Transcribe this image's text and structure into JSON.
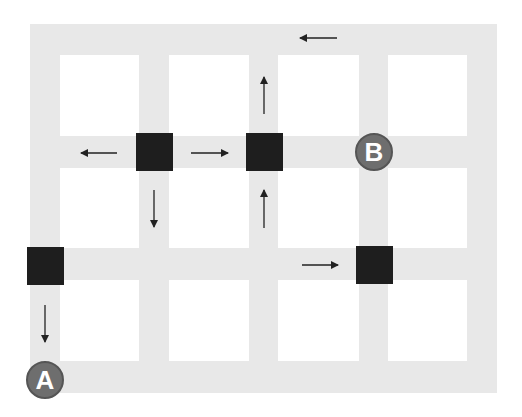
{
  "diagram": {
    "type": "street-grid-map",
    "colors": {
      "road": "#e8e8e8",
      "block": "#ffffff",
      "signal": "#1e1e1e",
      "marker": "#6e6e6e",
      "marker_text": "#ffffff",
      "arrow": "#222222"
    },
    "outer": {
      "x": 30,
      "y": 24,
      "w": 467,
      "h": 369
    },
    "blocks": [
      {
        "x": 60,
        "y": 55,
        "w": 79,
        "h": 81
      },
      {
        "x": 169,
        "y": 55,
        "w": 80,
        "h": 81
      },
      {
        "x": 278,
        "y": 55,
        "w": 81,
        "h": 81
      },
      {
        "x": 388,
        "y": 55,
        "w": 79,
        "h": 81
      },
      {
        "x": 60,
        "y": 168,
        "w": 79,
        "h": 80
      },
      {
        "x": 169,
        "y": 168,
        "w": 80,
        "h": 80
      },
      {
        "x": 278,
        "y": 168,
        "w": 81,
        "h": 80
      },
      {
        "x": 388,
        "y": 168,
        "w": 79,
        "h": 80
      },
      {
        "x": 60,
        "y": 280,
        "w": 79,
        "h": 81
      },
      {
        "x": 169,
        "y": 280,
        "w": 80,
        "h": 81
      },
      {
        "x": 278,
        "y": 280,
        "w": 81,
        "h": 81
      },
      {
        "x": 388,
        "y": 280,
        "w": 79,
        "h": 81
      }
    ],
    "signals": [
      {
        "x": 136,
        "y": 133,
        "w": 37,
        "h": 38
      },
      {
        "x": 246,
        "y": 133,
        "w": 37,
        "h": 38
      },
      {
        "x": 27,
        "y": 247,
        "w": 37,
        "h": 38
      },
      {
        "x": 356,
        "y": 246,
        "w": 37,
        "h": 38
      }
    ],
    "markers": [
      {
        "label": "B",
        "cx": 374,
        "cy": 152,
        "r": 19
      },
      {
        "label": "A",
        "cx": 45,
        "cy": 380,
        "r": 19
      }
    ],
    "arrows": [
      {
        "direction": "left",
        "x1": 337,
        "y1": 38,
        "x2": 300,
        "y2": 38
      },
      {
        "direction": "left",
        "x1": 117,
        "y1": 153,
        "x2": 81,
        "y2": 153
      },
      {
        "direction": "right",
        "x1": 191,
        "y1": 153,
        "x2": 228,
        "y2": 153
      },
      {
        "direction": "up",
        "x1": 264,
        "y1": 114,
        "x2": 264,
        "y2": 77
      },
      {
        "direction": "up",
        "x1": 264,
        "y1": 228,
        "x2": 264,
        "y2": 190
      },
      {
        "direction": "down",
        "x1": 154,
        "y1": 190,
        "x2": 154,
        "y2": 227
      },
      {
        "direction": "down",
        "x1": 45,
        "y1": 305,
        "x2": 45,
        "y2": 342
      },
      {
        "direction": "right",
        "x1": 302,
        "y1": 265,
        "x2": 338,
        "y2": 265
      }
    ]
  }
}
